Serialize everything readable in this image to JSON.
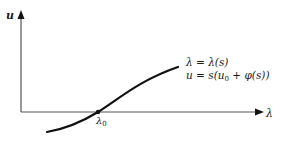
{
  "diagram": {
    "axes": {
      "y_label": "u",
      "x_label": "λ"
    },
    "point_label": {
      "symbol": "λ",
      "subscript": "0"
    },
    "equations": [
      {
        "lhs": "λ",
        "eq": " = ",
        "rhs": "λ(s)"
      },
      {
        "lhs": "u",
        "eq": " = ",
        "rhs_pre": "s(u",
        "rhs_sub": "0",
        "rhs_post": " + φ(s))"
      }
    ],
    "colors": {
      "axis": "#555555",
      "curve": "#111111",
      "background": "#ffffff"
    }
  }
}
